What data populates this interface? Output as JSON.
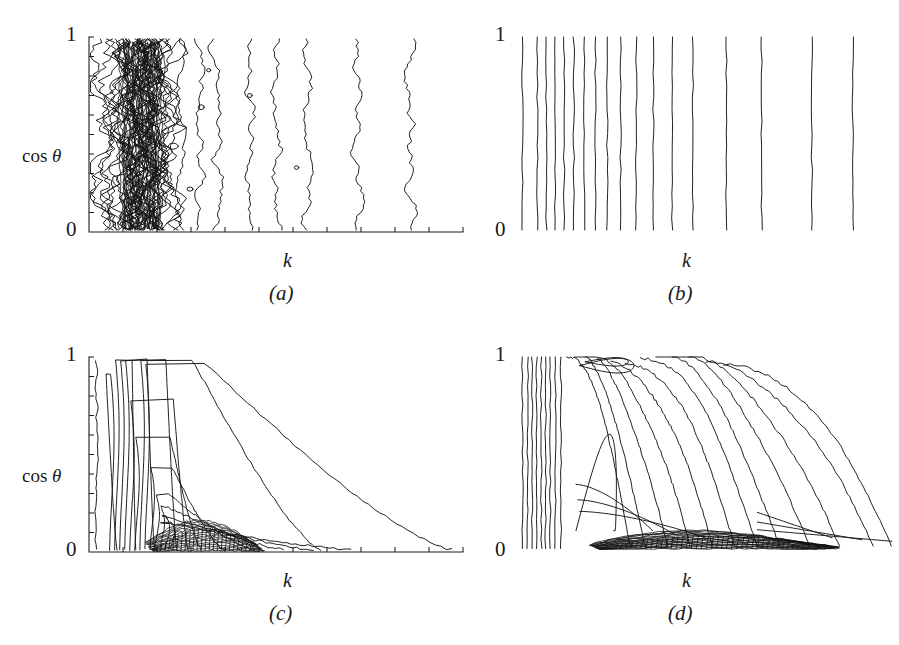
{
  "figure": {
    "background": "#ffffff",
    "ink": "#1a1a1a",
    "layout": "2x2-grid"
  },
  "chart_data": [
    {
      "id": "a",
      "type": "contour",
      "title": "",
      "caption": "(a)",
      "xlabel": "k",
      "ylabel": "cos θ",
      "ylabel_parts": {
        "prefix": "cos ",
        "symbol": "θ"
      },
      "ytick_labels": [
        "0",
        "1"
      ],
      "ylim": [
        0,
        1
      ],
      "xlim": [
        0,
        1
      ],
      "grid": false,
      "legend": "none",
      "axis_spines": [
        "left",
        "bottom"
      ],
      "x_minor_ticks": 11,
      "y_minor_ticks": 10,
      "description": "very noisy near-vertical jagged contours, extremely dense cluster at small k, isolated wavy vertical lines spreading to the right",
      "contour_count": 20,
      "noise_amplitude": 0.055,
      "line_x_positions": [
        0.035,
        0.075,
        0.098,
        0.112,
        0.124,
        0.133,
        0.141,
        0.152,
        0.163,
        0.178,
        0.196,
        0.215,
        0.247,
        0.295,
        0.345,
        0.43,
        0.5,
        0.585,
        0.72,
        0.86
      ],
      "density_profile": "log-crowded-left"
    },
    {
      "id": "b",
      "type": "contour",
      "title": "",
      "caption": "(b)",
      "xlabel": "k",
      "ylabel": "",
      "ytick_labels": [
        "0",
        "1"
      ],
      "ylim": [
        0,
        1
      ],
      "xlim": [
        0,
        1
      ],
      "grid": false,
      "legend": "none",
      "axis_spines": [],
      "x_minor_ticks": 0,
      "y_minor_ticks": 0,
      "description": "perfectly straight vertical contour lines, evenly crowded on the left and progressively wider apart to the right",
      "contour_count": 18,
      "noise_amplitude": 0.004,
      "line_x_positions": [
        0.012,
        0.052,
        0.076,
        0.1,
        0.124,
        0.15,
        0.178,
        0.208,
        0.24,
        0.276,
        0.318,
        0.364,
        0.414,
        0.47,
        0.56,
        0.655,
        0.79,
        0.9
      ],
      "density_profile": "monotone-expanding"
    },
    {
      "id": "c",
      "type": "contour",
      "type_detail": "decaying-ridge",
      "caption": "(c)",
      "xlabel": "k",
      "ylabel": "cos θ",
      "ylabel_parts": {
        "prefix": "cos ",
        "symbol": "θ"
      },
      "ytick_labels": [
        "0",
        "1"
      ],
      "ylim": [
        0,
        1
      ],
      "xlim": [
        0,
        1
      ],
      "grid": false,
      "legend": "none",
      "axis_spines": [
        "left",
        "bottom"
      ],
      "x_minor_ticks": 11,
      "y_minor_ticks": 10,
      "description": "nested contours rising near small k then decaying hyperbolically toward large k; a dense black band of many closely packed contours hugs cos theta = 0 between k = 0.18 and k = 0.42",
      "contour_count": 13,
      "noise_amplitude": 0.012,
      "dense_band": {
        "x_start": 0.17,
        "x_end": 0.44,
        "y_top": 0.135,
        "lines": 16
      },
      "levels": [
        {
          "peak_y": 0.93,
          "x_peak": 0.045,
          "x_end": 0.075
        },
        {
          "peak_y": 1.0,
          "x_peak": 0.115,
          "x_end": 0.125
        },
        {
          "peak_y": 1.0,
          "x_peak": 0.155,
          "x_end": 0.175
        },
        {
          "peak_y": 1.0,
          "x_peak": 0.205,
          "x_end": 0.235
        },
        {
          "peak_y": 0.79,
          "x_peak": 0.225,
          "x_end": 0.265
        },
        {
          "peak_y": 0.6,
          "x_peak": 0.215,
          "x_end": 0.3
        },
        {
          "peak_y": 1.0,
          "x_peak": 0.27,
          "x_end": 0.62
        },
        {
          "peak_y": 0.98,
          "x_peak": 0.3,
          "x_end": 0.97
        },
        {
          "peak_y": 0.44,
          "x_peak": 0.22,
          "x_end": 0.36
        },
        {
          "peak_y": 0.3,
          "x_peak": 0.21,
          "x_end": 0.44
        },
        {
          "peak_y": 0.235,
          "x_peak": 0.2,
          "x_end": 0.52
        },
        {
          "peak_y": 0.185,
          "x_peak": 0.19,
          "x_end": 0.6
        },
        {
          "peak_y": 0.155,
          "x_peak": 0.185,
          "x_end": 0.7
        }
      ]
    },
    {
      "id": "d",
      "type": "contour",
      "type_detail": "diagonal-cascade",
      "caption": "(d)",
      "xlabel": "k",
      "ylabel": "",
      "ytick_labels": [
        "0",
        "1"
      ],
      "ylim": [
        0,
        1
      ],
      "xlim": [
        0,
        1
      ],
      "grid": false,
      "legend": "none",
      "axis_spines": [],
      "x_minor_ticks": 0,
      "y_minor_ticks": 0,
      "description": "tightly packed vertical contours at the left edge fanning out into long diagonal curves that cascade down to the right; a dense black band of merged contours along cos theta = 0 from k = 0.25 to k = 0.75",
      "contour_count": 22,
      "noise_amplitude": 0.016,
      "dense_band": {
        "x_start": 0.22,
        "x_end": 0.8,
        "y_top": 0.075,
        "lines": 20
      },
      "left_bundle_x": [
        0.012,
        0.026,
        0.038,
        0.05,
        0.062,
        0.074,
        0.086,
        0.1,
        0.115
      ],
      "cascade_ends": [
        0.3,
        0.34,
        0.4,
        0.46,
        0.52,
        0.58,
        0.64,
        0.7,
        0.78,
        0.86,
        0.95,
        1.0
      ]
    }
  ]
}
